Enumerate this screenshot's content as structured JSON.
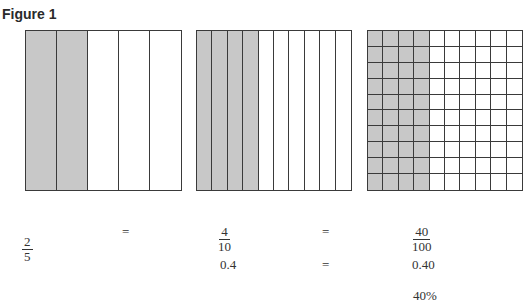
{
  "figure": {
    "title": "Figure 1",
    "models": [
      {
        "id": "fifths",
        "columns": 5,
        "rows": 1,
        "shaded_columns": 2
      },
      {
        "id": "tenths",
        "columns": 10,
        "rows": 1,
        "shaded_columns": 4
      },
      {
        "id": "hundredths",
        "columns": 10,
        "rows": 10,
        "shaded_columns": 4
      }
    ],
    "shade_color": "#c8c8c8",
    "line_color": "#3a3a3a"
  },
  "equations": {
    "row1": {
      "frac1": {
        "num": "2",
        "den": "5"
      },
      "eq1": "=",
      "frac2": {
        "num": "4",
        "den": "10"
      },
      "eq2": "=",
      "frac3": {
        "num": "40",
        "den": "100"
      }
    },
    "row2": {
      "dec1": "0.4",
      "eq": "=",
      "dec2": "0.40"
    },
    "row3": {
      "percent": "40%"
    }
  }
}
